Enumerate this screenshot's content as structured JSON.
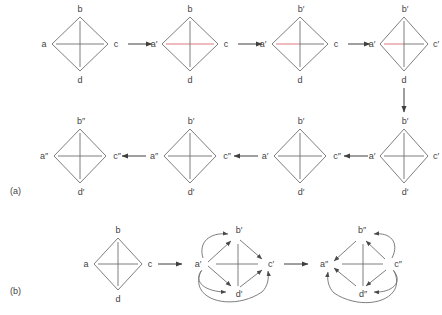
{
  "figure": {
    "panels": [
      {
        "id": "a",
        "label": "(a)"
      },
      {
        "id": "b",
        "label": "(b)"
      }
    ],
    "colors": {
      "edge": "#6f6f6f",
      "cross": "#6f6f6f",
      "highlight": "#d96b72",
      "arrow": "#3f3f3f",
      "text": "#3f3f3f",
      "background": "#ffffff"
    }
  },
  "panel_a": {
    "label": "(a)",
    "row1": [
      {
        "name": "graph-a1",
        "vertices": {
          "left": "a",
          "top": "b",
          "right": "c",
          "bottom": "d"
        },
        "cross_horizontal_color": "#6f6f6f",
        "cross_vertical_color": "#6f6f6f",
        "highlight": "none"
      },
      {
        "name": "graph-a2",
        "vertices": {
          "left": "a′",
          "top": "b",
          "right": "c",
          "bottom": "d"
        },
        "cross_horizontal_color": "#d96b72",
        "cross_vertical_color": "#6f6f6f",
        "highlight": "horizontal"
      },
      {
        "name": "graph-a3",
        "vertices": {
          "left": "a′",
          "top": "b′",
          "right": "c",
          "bottom": "d"
        },
        "cross_horizontal_color": "#d96b72",
        "cross_vertical_color": "#6f6f6f",
        "highlight": "horizontal-left"
      },
      {
        "name": "graph-a4",
        "vertices": {
          "left": "a′",
          "top": "b′",
          "right": "c′",
          "bottom": "d"
        },
        "cross_horizontal_color": "#d96b72",
        "cross_vertical_color": "#6f6f6f",
        "highlight": "horizontal-left-short"
      }
    ],
    "row2": [
      {
        "name": "graph-a8",
        "vertices": {
          "left": "a″",
          "top": "b″",
          "right": "c″",
          "bottom": "d′"
        },
        "cross_horizontal_color": "#6f6f6f",
        "cross_vertical_color": "#6f6f6f",
        "highlight": "none"
      },
      {
        "name": "graph-a7",
        "vertices": {
          "left": "a″",
          "top": "b′",
          "right": "c″",
          "bottom": "d′"
        },
        "cross_horizontal_color": "#6f6f6f",
        "cross_vertical_color": "#6f6f6f",
        "highlight": "none"
      },
      {
        "name": "graph-a6",
        "vertices": {
          "left": "a′",
          "top": "b′",
          "right": "c″",
          "bottom": "d′"
        },
        "cross_horizontal_color": "#6f6f6f",
        "cross_vertical_color": "#6f6f6f",
        "highlight": "none"
      },
      {
        "name": "graph-a5",
        "vertices": {
          "left": "a′",
          "top": "b′",
          "right": "c′",
          "bottom": "d′"
        },
        "cross_horizontal_color": "#6f6f6f",
        "cross_vertical_color": "#6f6f6f",
        "highlight": "none"
      }
    ],
    "arrows": [
      {
        "name": "arrow-a1-a2",
        "direction": "right"
      },
      {
        "name": "arrow-a2-a3",
        "direction": "right"
      },
      {
        "name": "arrow-a3-a4",
        "direction": "right"
      },
      {
        "name": "arrow-a4-a5",
        "direction": "down"
      },
      {
        "name": "arrow-a5-a6",
        "direction": "left"
      },
      {
        "name": "arrow-a6-a7",
        "direction": "left"
      },
      {
        "name": "arrow-a7-a8",
        "direction": "left"
      }
    ]
  },
  "panel_b": {
    "label": "(b)",
    "graphs": [
      {
        "name": "graph-b1",
        "vertices": {
          "left": "a",
          "top": "b",
          "right": "c",
          "bottom": "d"
        },
        "directed": false,
        "arcs": []
      },
      {
        "name": "graph-b2",
        "vertices": {
          "left": "a′",
          "top": "b′",
          "right": "c′",
          "bottom": "d′"
        },
        "directed": true,
        "edge_arrows": [
          "a′→b′",
          "a′→d′",
          "b′→c′",
          "d′→c′"
        ],
        "arcs": [
          "a′→b′",
          "a′→d′",
          "a′→c′"
        ]
      },
      {
        "name": "graph-b3",
        "vertices": {
          "left": "a″",
          "top": "b″",
          "right": "c″",
          "bottom": "d″"
        },
        "directed": true,
        "edge_arrows": [
          "b″→a″",
          "d″→a″",
          "c″→b″",
          "c″→d″"
        ],
        "arcs": [
          "c″→b″",
          "c″→d″",
          "c″→a″"
        ]
      }
    ],
    "arrows": [
      {
        "name": "arrow-b1-b2",
        "direction": "right"
      },
      {
        "name": "arrow-b2-b3",
        "direction": "right"
      }
    ]
  }
}
